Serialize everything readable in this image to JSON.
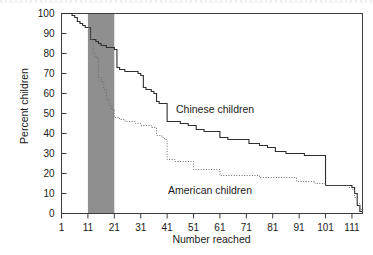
{
  "figure": {
    "background_color": "#ffffff",
    "frame_color": "#3c3c3c",
    "band_color": "#8f8f8f"
  },
  "axes": {
    "x_label": "Number reached",
    "y_label": "Percent children",
    "x_ticks": [
      "1",
      "11",
      "21",
      "31",
      "41",
      "51",
      "61",
      "71",
      "81",
      "91",
      "101",
      "111"
    ],
    "y_ticks": [
      "0",
      "10",
      "20",
      "30",
      "40",
      "50",
      "60",
      "70",
      "80",
      "90",
      "100"
    ]
  },
  "annotations": {
    "chinese_label": "Chinese children",
    "american_label": "American children"
  },
  "chart_data": {
    "type": "line",
    "title": "",
    "subtitle": "",
    "xlabel": "Number reached",
    "ylabel": "Percent children",
    "xlim": [
      1,
      115
    ],
    "ylim": [
      0,
      100
    ],
    "grid": false,
    "legend_position": "inline-annotation",
    "x_ticks": [
      1,
      11,
      21,
      31,
      41,
      51,
      61,
      71,
      81,
      91,
      101,
      111
    ],
    "y_ticks": [
      0,
      10,
      20,
      30,
      40,
      50,
      60,
      70,
      80,
      90,
      100
    ],
    "shaded_region": {
      "label": "",
      "x_start": 11,
      "x_end": 21,
      "color": "#8f8f8f"
    },
    "series": [
      {
        "name": "Chinese children",
        "style": "solid",
        "color": "#2e2e2e",
        "step": true,
        "points": [
          [
            1,
            100
          ],
          [
            4,
            100
          ],
          [
            5,
            99
          ],
          [
            6,
            98
          ],
          [
            7,
            96
          ],
          [
            8,
            95
          ],
          [
            9,
            94
          ],
          [
            10,
            93
          ],
          [
            11,
            93
          ],
          [
            12,
            87
          ],
          [
            13,
            87
          ],
          [
            14,
            86
          ],
          [
            15,
            85
          ],
          [
            16,
            84
          ],
          [
            17,
            84
          ],
          [
            18,
            83
          ],
          [
            19,
            83
          ],
          [
            21,
            83
          ],
          [
            21,
            82
          ],
          [
            22,
            73
          ],
          [
            23,
            72
          ],
          [
            25,
            71
          ],
          [
            26,
            71
          ],
          [
            29,
            71
          ],
          [
            30,
            70
          ],
          [
            31,
            69
          ],
          [
            32,
            63
          ],
          [
            33,
            62
          ],
          [
            35,
            61
          ],
          [
            36,
            60
          ],
          [
            37,
            56
          ],
          [
            38,
            55
          ],
          [
            40,
            55
          ],
          [
            41,
            55
          ],
          [
            41,
            46
          ],
          [
            43,
            46
          ],
          [
            46,
            45
          ],
          [
            49,
            44
          ],
          [
            51,
            44
          ],
          [
            52,
            42
          ],
          [
            55,
            41
          ],
          [
            58,
            41
          ],
          [
            61,
            41
          ],
          [
            61,
            38
          ],
          [
            64,
            37
          ],
          [
            68,
            37
          ],
          [
            71,
            37
          ],
          [
            72,
            35
          ],
          [
            76,
            34
          ],
          [
            79,
            33
          ],
          [
            81,
            33
          ],
          [
            82,
            31
          ],
          [
            86,
            30
          ],
          [
            89,
            30
          ],
          [
            91,
            30
          ],
          [
            93,
            29
          ],
          [
            97,
            29
          ],
          [
            100,
            29
          ],
          [
            101,
            29
          ],
          [
            101,
            14
          ],
          [
            105,
            14
          ],
          [
            108,
            14
          ],
          [
            110,
            14
          ],
          [
            111,
            13
          ],
          [
            112,
            10
          ],
          [
            113,
            4
          ],
          [
            114,
            1
          ],
          [
            115,
            0
          ]
        ]
      },
      {
        "name": "American children",
        "style": "dotted",
        "color": "#6e6e6e",
        "step": true,
        "points": [
          [
            11,
            93
          ],
          [
            12,
            87
          ],
          [
            13,
            80
          ],
          [
            14,
            78
          ],
          [
            15,
            72
          ],
          [
            15,
            68
          ],
          [
            16,
            66
          ],
          [
            17,
            62
          ],
          [
            18,
            60
          ],
          [
            18,
            57
          ],
          [
            19,
            55
          ],
          [
            19,
            54
          ],
          [
            20,
            52
          ],
          [
            21,
            50
          ],
          [
            21,
            48
          ],
          [
            23,
            47
          ],
          [
            25,
            46
          ],
          [
            27,
            46
          ],
          [
            29,
            45
          ],
          [
            31,
            44
          ],
          [
            33,
            44
          ],
          [
            35,
            43
          ],
          [
            36,
            43
          ],
          [
            37,
            39
          ],
          [
            39,
            38
          ],
          [
            40,
            37
          ],
          [
            41,
            37
          ],
          [
            41,
            27
          ],
          [
            44,
            26
          ],
          [
            47,
            26
          ],
          [
            50,
            26
          ],
          [
            51,
            26
          ],
          [
            51,
            22
          ],
          [
            54,
            22
          ],
          [
            57,
            22
          ],
          [
            60,
            22
          ],
          [
            61,
            22
          ],
          [
            61,
            19
          ],
          [
            65,
            19
          ],
          [
            69,
            19
          ],
          [
            73,
            19
          ],
          [
            76,
            18
          ],
          [
            80,
            18
          ],
          [
            84,
            18
          ],
          [
            87,
            18
          ],
          [
            89,
            18
          ],
          [
            90,
            16
          ],
          [
            94,
            16
          ],
          [
            97,
            15
          ],
          [
            100,
            15
          ],
          [
            101,
            15
          ],
          [
            101,
            14
          ],
          [
            104,
            14
          ],
          [
            108,
            14
          ],
          [
            110,
            13
          ],
          [
            111,
            12
          ],
          [
            112,
            8
          ],
          [
            113,
            5
          ],
          [
            114,
            2
          ],
          [
            115,
            0
          ]
        ]
      }
    ]
  }
}
